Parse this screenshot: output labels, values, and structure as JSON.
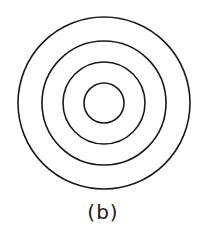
{
  "diagram": {
    "center": {
      "x": 104,
      "y": 103
    },
    "circles": [
      {
        "r": 86
      },
      {
        "r": 62
      },
      {
        "r": 41
      },
      {
        "r": 20
      }
    ],
    "stroke_color": "#1a1a1a",
    "stroke_width": 1.6
  },
  "caption": {
    "label": "(b)"
  }
}
